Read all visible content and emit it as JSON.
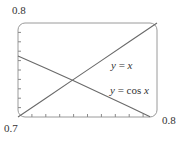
{
  "chart_data": {
    "type": "line",
    "title": "",
    "xlabel": "",
    "ylabel": "",
    "xlim": [
      0.7,
      0.8
    ],
    "ylim": [
      0.7,
      0.8
    ],
    "grid": false,
    "frame": "rounded-rectangle",
    "x_ticks_minor_step": 0.01,
    "y_ticks_minor_step": 0.01,
    "tick_labels": {
      "y_top": "0.8",
      "origin": "0.7",
      "x_right": "0.8"
    },
    "series": [
      {
        "name": "y = x",
        "function": "x",
        "x": [
          0.7,
          0.72,
          0.74,
          0.76,
          0.78,
          0.8
        ],
        "values": [
          0.7,
          0.72,
          0.74,
          0.76,
          0.78,
          0.8
        ]
      },
      {
        "name": "y = cos x",
        "function": "cos(x)",
        "x": [
          0.7,
          0.72,
          0.74,
          0.76,
          0.78,
          0.795
        ],
        "values": [
          0.7648,
          0.7518,
          0.7385,
          0.7248,
          0.7109,
          0.7003
        ]
      }
    ],
    "annotations": [
      {
        "text": "y = x",
        "x": 0.765,
        "y": 0.752
      },
      {
        "text": "y = cos x",
        "x": 0.765,
        "y": 0.72
      }
    ],
    "intersection": {
      "x": 0.739,
      "y": 0.739
    }
  },
  "labels": {
    "y_top": "0.8",
    "origin": "0.7",
    "x_right": "0.8",
    "curve_x_y": "y",
    "curve_x_eq": " = ",
    "curve_x_x": "x",
    "curve_cos_y": "y",
    "curve_cos_eq": " = cos ",
    "curve_cos_x": "x"
  }
}
